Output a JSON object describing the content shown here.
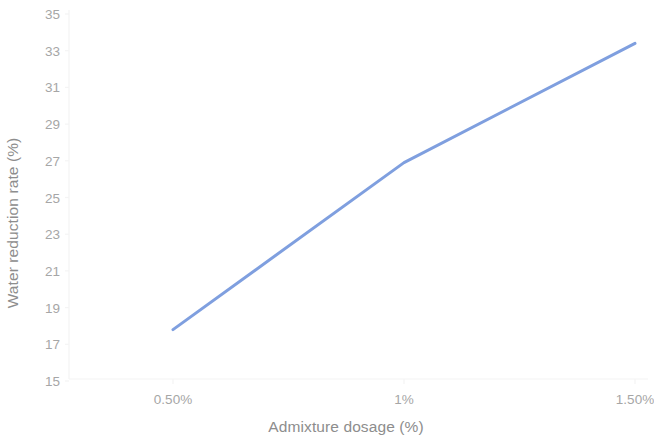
{
  "chart_data": {
    "type": "line",
    "title": "",
    "xlabel": "Admixture dosage (%)",
    "ylabel": "Water reduction rate (%)",
    "x": [
      0.5,
      1.0,
      1.5
    ],
    "x_tick_labels": [
      "0.50%",
      "1%",
      "1.50%"
    ],
    "y_tick_labels": [
      "35",
      "33",
      "31",
      "29",
      "27",
      "25",
      "23",
      "21",
      "19",
      "17",
      "15"
    ],
    "y_ticks": [
      35,
      33,
      31,
      29,
      27,
      25,
      23,
      21,
      19,
      17,
      15
    ],
    "ylim": [
      15,
      35
    ],
    "xlim": [
      0.5,
      1.5
    ],
    "grid": false,
    "legend": false,
    "series": [
      {
        "name": "Water reduction rate",
        "values": [
          17.8,
          26.9,
          33.4
        ],
        "color": "#7f9fdf",
        "line_width": 3,
        "markers": false
      }
    ]
  },
  "axes": {
    "y_title": "Water reduction rate (%)",
    "x_title": "Admixture dosage (%)",
    "axis_line_color": "#f2f2f2",
    "tick_label_color": "#a6a6a6",
    "axis_title_color": "#8d8d8d"
  }
}
